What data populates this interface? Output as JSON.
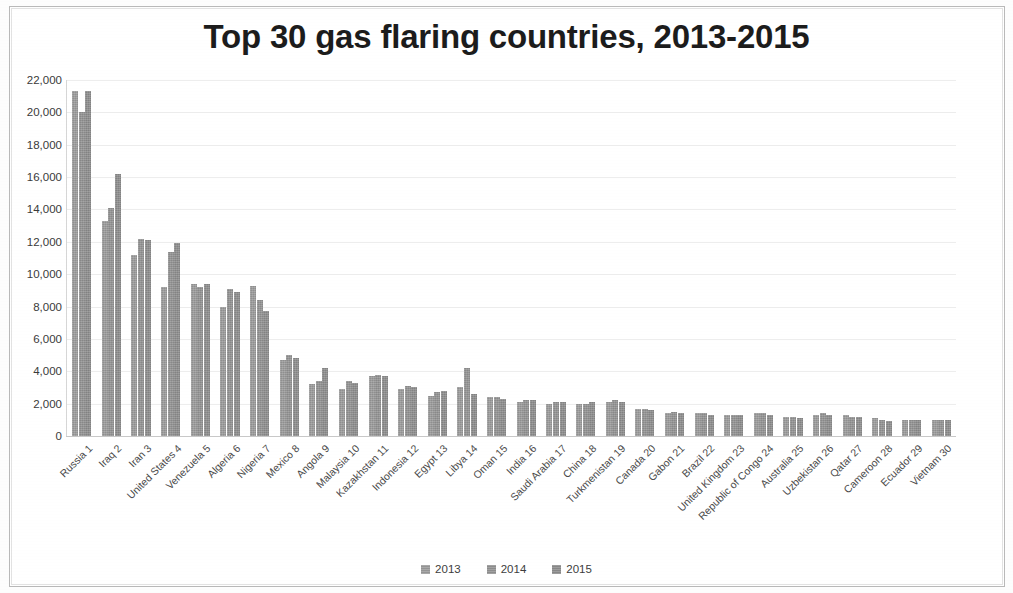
{
  "chart_data": {
    "type": "bar",
    "title": "Top 30 gas flaring countries, 2013-2015",
    "xlabel": "",
    "ylabel": "",
    "ylim": [
      0,
      22000
    ],
    "ytick_step": 2000,
    "yticks": [
      "22,000",
      "20,000",
      "18,000",
      "16,000",
      "14,000",
      "12,000",
      "10,000",
      "8,000",
      "6,000",
      "4,000",
      "2,000",
      "0"
    ],
    "grid": true,
    "legend_position": "bottom",
    "legend": [
      "2013",
      "2014",
      "2015"
    ],
    "categories": [
      "Russia 1",
      "Iraq 2",
      "Iran 3",
      "United States 4",
      "Venezuela 5",
      "Algeria 6",
      "Nigeria 7",
      "Mexico 8",
      "Angola 9",
      "Malaysia 10",
      "Kazakhstan 11",
      "Indonesia 12",
      "Egypt 13",
      "Libya 14",
      "Oman 15",
      "India 16",
      "Saudi Arabia 17",
      "China 18",
      "Turkmenistan 19",
      "Canada 20",
      "Gabon 21",
      "Brazil 22",
      "United Kingdom 23",
      "Republic of Congo 24",
      "Australia 25",
      "Uzbekistan 26",
      "Qatar 27",
      "Cameroon 28",
      "Ecuador 29",
      "Vietnam 30"
    ],
    "series": [
      {
        "name": "2013",
        "color": "#9d9d9d",
        "values": [
          21300,
          13300,
          11200,
          9200,
          9400,
          8000,
          9300,
          4700,
          3200,
          2900,
          3700,
          2900,
          2500,
          3000,
          2400,
          2100,
          2000,
          2000,
          2100,
          1700,
          1400,
          1400,
          1300,
          1400,
          1200,
          1300,
          1300,
          1100,
          1000,
          1000
        ]
      },
      {
        "name": "2014",
        "color": "#959595",
        "values": [
          20000,
          14100,
          12200,
          11400,
          9200,
          9100,
          8400,
          5000,
          3400,
          3400,
          3800,
          3100,
          2700,
          4200,
          2400,
          2200,
          2100,
          2000,
          2200,
          1700,
          1500,
          1400,
          1300,
          1400,
          1200,
          1400,
          1200,
          1000,
          1000,
          1000
        ]
      },
      {
        "name": "2015",
        "color": "#8f8f8f",
        "values": [
          21300,
          16200,
          12100,
          11900,
          9400,
          8900,
          7700,
          4800,
          4200,
          3300,
          3700,
          3000,
          2800,
          2600,
          2300,
          2200,
          2100,
          2100,
          2100,
          1600,
          1400,
          1300,
          1300,
          1300,
          1100,
          1300,
          1200,
          900,
          1000,
          1000
        ]
      }
    ]
  }
}
